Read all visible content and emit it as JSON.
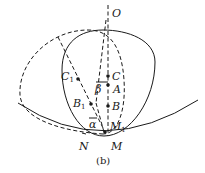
{
  "figure": {
    "caption": "(b)",
    "points": {
      "O": {
        "label": "O",
        "sub": ""
      },
      "C1": {
        "label": "C",
        "sub": "1"
      },
      "C": {
        "label": "C",
        "sub": ""
      },
      "A": {
        "label": "A",
        "sub": ""
      },
      "B1": {
        "label": "B",
        "sub": "1"
      },
      "B": {
        "label": "B",
        "sub": ""
      },
      "M1": {
        "label": "M",
        "sub": "1"
      },
      "N": {
        "label": "N",
        "sub": ""
      },
      "M": {
        "label": "M",
        "sub": ""
      }
    },
    "angles": {
      "alpha": "α",
      "beta": "β"
    },
    "colors": {
      "stroke": "#1a1a1a",
      "background": "#ffffff"
    }
  }
}
